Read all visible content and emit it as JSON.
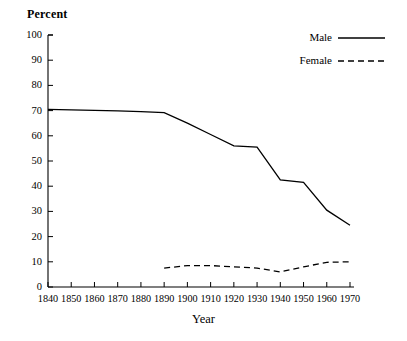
{
  "chart_data": {
    "type": "line",
    "title": "",
    "xlabel": "Year",
    "ylabel": "Percent",
    "xlim": [
      1840,
      1970
    ],
    "ylim": [
      0,
      100
    ],
    "grid": false,
    "legend_position": "top-right",
    "x_ticks": [
      1840,
      1850,
      1860,
      1870,
      1880,
      1890,
      1900,
      1910,
      1920,
      1930,
      1940,
      1950,
      1960,
      1970
    ],
    "x_tick_labels": [
      "1840",
      "1850",
      "1860",
      "1870",
      "1880",
      "1890",
      "1900",
      "1910",
      "1920",
      "1930",
      "1940",
      "1950",
      "1960",
      "1970"
    ],
    "y_ticks": [
      0,
      10,
      20,
      30,
      40,
      50,
      60,
      70,
      80,
      90,
      100
    ],
    "y_tick_labels": [
      "0",
      "10",
      "20",
      "30",
      "40",
      "50",
      "60",
      "70",
      "80",
      "90",
      "100"
    ],
    "series": [
      {
        "name": "Male",
        "style": "solid",
        "color": "#000000",
        "x": [
          1840,
          1850,
          1860,
          1870,
          1880,
          1890,
          1900,
          1910,
          1920,
          1930,
          1940,
          1950,
          1960,
          1970
        ],
        "values": [
          70.5,
          70.3,
          70.1,
          69.9,
          69.6,
          69.2,
          65.0,
          60.5,
          56.0,
          55.5,
          42.5,
          41.5,
          30.5,
          24.5
        ]
      },
      {
        "name": "Female",
        "style": "dashed",
        "color": "#000000",
        "x": [
          1890,
          1900,
          1910,
          1920,
          1930,
          1940,
          1950,
          1960,
          1970
        ],
        "values": [
          7.5,
          8.5,
          8.5,
          8.0,
          7.5,
          6.0,
          8.0,
          9.8,
          10.0
        ]
      }
    ]
  },
  "legend": {
    "entries": [
      {
        "label": "Male",
        "style": "solid"
      },
      {
        "label": "Female",
        "style": "dashed"
      }
    ]
  },
  "axis": {
    "y_title": "Percent",
    "x_title": "Year"
  }
}
